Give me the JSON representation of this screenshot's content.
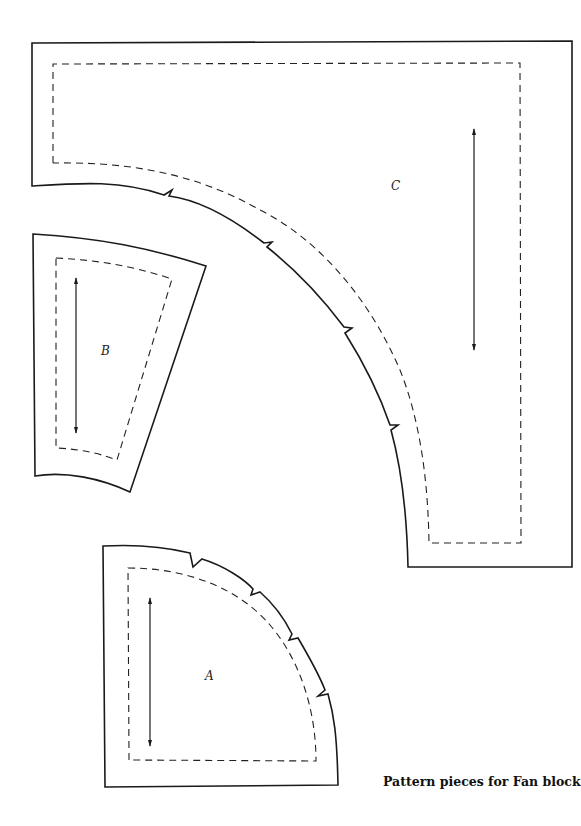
{
  "caption": "Pattern pieces for Fan block",
  "pieces": {
    "A": {
      "label": "A",
      "shape": "quarter-circle fan center",
      "notches": 4
    },
    "B": {
      "label": "B",
      "shape": "fan blade wedge",
      "notches": 0
    },
    "C": {
      "label": "C",
      "shape": "corner background with concave arc",
      "notches": 4
    }
  },
  "legend": {
    "solid_line": "cutting line",
    "dashed_line": "seam line",
    "double_arrow": "grain line"
  },
  "colors": {
    "line": "#1a1a1a",
    "background": "#ffffff"
  }
}
